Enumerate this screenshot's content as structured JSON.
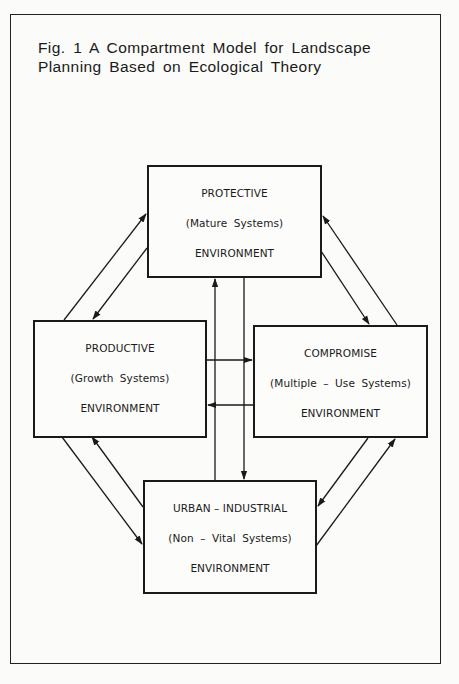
{
  "figure": {
    "title_line1": "Fig. 1  A Compartment Model for Landscape",
    "title_line2": "Planning Based on Ecological Theory"
  },
  "compartments": {
    "protective": {
      "name": "PROTECTIVE",
      "systems": "(Mature Systems)",
      "label": "ENVIRONMENT"
    },
    "productive": {
      "name": "PRODUCTIVE",
      "systems": "(Growth Systems)",
      "label": "ENVIRONMENT"
    },
    "compromise": {
      "name": "COMPROMISE",
      "systems": "(Multiple – Use Systems)",
      "label": "ENVIRONMENT"
    },
    "urban_industrial": {
      "name": "URBAN – INDUSTRIAL",
      "systems": "(Non – Vital  Systems)",
      "label": "ENVIRONMENT"
    }
  },
  "flows": [
    {
      "from": "productive",
      "to": "protective"
    },
    {
      "from": "protective",
      "to": "productive"
    },
    {
      "from": "protective",
      "to": "compromise"
    },
    {
      "from": "compromise",
      "to": "protective"
    },
    {
      "from": "productive",
      "to": "urban_industrial"
    },
    {
      "from": "urban_industrial",
      "to": "productive"
    },
    {
      "from": "compromise",
      "to": "urban_industrial"
    },
    {
      "from": "urban_industrial",
      "to": "compromise"
    },
    {
      "from": "productive",
      "to": "compromise"
    },
    {
      "from": "compromise",
      "to": "productive"
    },
    {
      "from": "urban_industrial",
      "to": "protective"
    },
    {
      "from": "protective",
      "to": "urban_industrial"
    }
  ],
  "colors": {
    "ink": "#1a1a1a",
    "paper": "#fbfbf9"
  }
}
